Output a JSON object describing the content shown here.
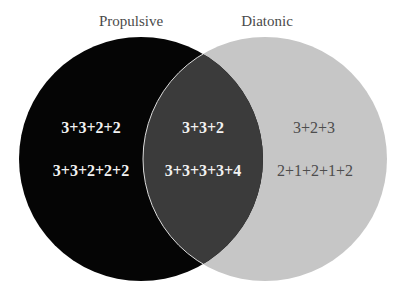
{
  "diagram": {
    "type": "venn",
    "sets": [
      {
        "id": "propulsive",
        "title": "Propulsive",
        "color": "#050505",
        "center": [
          141,
          159
        ],
        "radius": 122
      },
      {
        "id": "diatonic",
        "title": "Diatonic",
        "color": "#c6c6c6",
        "center": [
          265,
          159
        ],
        "radius": 122
      }
    ],
    "intersection_color": "#3b3b3b",
    "outline_color": "#dcdcdc",
    "regions": {
      "propulsive_only": {
        "items": [
          "3+3+2+2",
          "3+3+2+2+2"
        ]
      },
      "both": {
        "items": [
          "3+3+2",
          "3+3+3+3+4"
        ]
      },
      "diatonic_only": {
        "items": [
          "3+2+3",
          "2+1+2+1+2"
        ]
      }
    }
  }
}
